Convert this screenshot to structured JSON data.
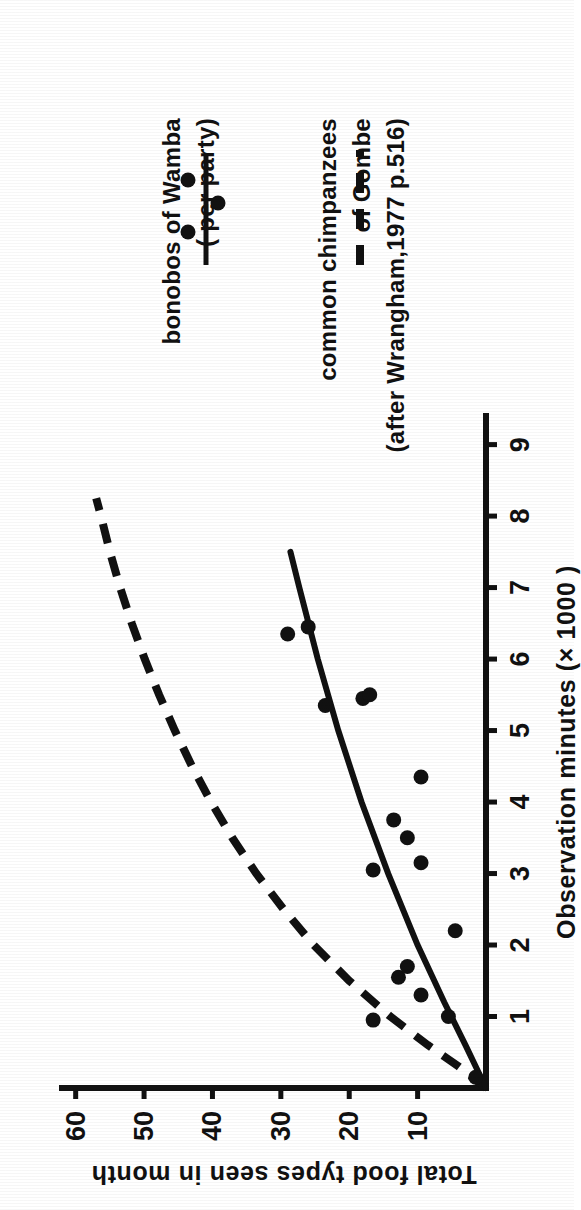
{
  "figure": {
    "background_color": "#ffffff",
    "ink_color": "#111111"
  },
  "axes": {
    "x_title": "Observation minutes (× 1000 )",
    "y_title": "Total food types seen in month",
    "x_ticks": [
      "1",
      "2",
      "3",
      "4",
      "5",
      "6",
      "7",
      "8",
      "9"
    ],
    "y_ticks": [
      "10",
      "20",
      "30",
      "40",
      "50",
      "60"
    ]
  },
  "legend": {
    "items": [
      {
        "marker": "dashed-line",
        "line1": "common chimpanzees",
        "line2": "of Gombe",
        "line3": "(after Wrangham,1977 p.516)"
      },
      {
        "marker": "solid-line-with-dots",
        "line1": "bonobos of Wamba",
        "line2": "( per party)",
        "line3": ""
      }
    ]
  },
  "chart_data": {
    "type": "scatter",
    "title": "",
    "xlabel": "Observation minutes (× 1000 )",
    "ylabel": "Total food types seen in month",
    "xlim": [
      0,
      9.4
    ],
    "ylim": [
      0,
      62
    ],
    "xticks": [
      1,
      2,
      3,
      4,
      5,
      6,
      7,
      8,
      9
    ],
    "yticks": [
      10,
      20,
      30,
      40,
      50,
      60
    ],
    "grid": false,
    "legend_position": "upper-right-outside",
    "series": [
      {
        "name": "bonobos of Wamba ( per party)",
        "type": "scatter",
        "marker": "filled-circle",
        "color": "#111111",
        "points": [
          {
            "x": 0.15,
            "y": 1.5
          },
          {
            "x": 0.95,
            "y": 16.5
          },
          {
            "x": 1.0,
            "y": 5.5
          },
          {
            "x": 1.3,
            "y": 9.5
          },
          {
            "x": 1.55,
            "y": 12.8
          },
          {
            "x": 1.7,
            "y": 11.5
          },
          {
            "x": 2.2,
            "y": 4.5
          },
          {
            "x": 3.05,
            "y": 16.5
          },
          {
            "x": 3.15,
            "y": 9.5
          },
          {
            "x": 3.5,
            "y": 11.5
          },
          {
            "x": 3.75,
            "y": 13.5
          },
          {
            "x": 4.35,
            "y": 9.5
          },
          {
            "x": 5.35,
            "y": 23.5
          },
          {
            "x": 5.45,
            "y": 18.0
          },
          {
            "x": 5.5,
            "y": 17.0
          },
          {
            "x": 6.35,
            "y": 29.0
          },
          {
            "x": 6.45,
            "y": 26.0
          }
        ]
      },
      {
        "name": "bonobos of Wamba fitted curve",
        "type": "line",
        "style": "solid",
        "color": "#111111",
        "points": [
          {
            "x": 0.0,
            "y": 0
          },
          {
            "x": 0.6,
            "y": 3.0
          },
          {
            "x": 1.2,
            "y": 6.1
          },
          {
            "x": 2.0,
            "y": 10.0
          },
          {
            "x": 3.0,
            "y": 14.3
          },
          {
            "x": 4.0,
            "y": 18.2
          },
          {
            "x": 5.0,
            "y": 21.6
          },
          {
            "x": 6.0,
            "y": 24.6
          },
          {
            "x": 7.0,
            "y": 27.3
          },
          {
            "x": 7.5,
            "y": 28.6
          }
        ]
      },
      {
        "name": "common chimpanzees of Gombe (after Wrangham,1977 p.516)",
        "type": "line",
        "style": "dashed",
        "color": "#111111",
        "points": [
          {
            "x": 0.0,
            "y": 0
          },
          {
            "x": 0.3,
            "y": 4.0
          },
          {
            "x": 0.6,
            "y": 8.5
          },
          {
            "x": 1.0,
            "y": 14.0
          },
          {
            "x": 1.5,
            "y": 20.0
          },
          {
            "x": 2.0,
            "y": 25.2
          },
          {
            "x": 2.5,
            "y": 29.6
          },
          {
            "x": 3.0,
            "y": 33.6
          },
          {
            "x": 3.5,
            "y": 37.1
          },
          {
            "x": 4.0,
            "y": 40.2
          },
          {
            "x": 4.5,
            "y": 43.0
          },
          {
            "x": 5.0,
            "y": 45.5
          },
          {
            "x": 5.5,
            "y": 47.8
          },
          {
            "x": 6.0,
            "y": 49.9
          },
          {
            "x": 6.5,
            "y": 51.8
          },
          {
            "x": 7.0,
            "y": 53.5
          },
          {
            "x": 7.5,
            "y": 55.0
          },
          {
            "x": 8.0,
            "y": 56.3
          },
          {
            "x": 8.25,
            "y": 57.0
          }
        ]
      }
    ]
  }
}
